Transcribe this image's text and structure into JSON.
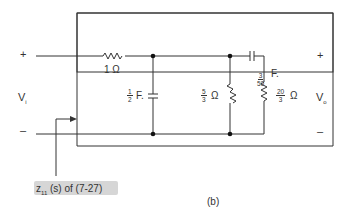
{
  "diagram": {
    "caption": "(b)",
    "annotation": {
      "prefix": "z",
      "sub": "11",
      "text": " (s) of (7-27)"
    },
    "input": {
      "plus": "+",
      "minus": "–",
      "label": "V",
      "label_sub": "i"
    },
    "output": {
      "plus": "+",
      "minus": "–",
      "label": "V",
      "label_sub": "o"
    },
    "components": {
      "r1": {
        "value": "1 Ω"
      },
      "c1": {
        "num": "1",
        "den": "2",
        "unit": "F."
      },
      "r2": {
        "num": "5",
        "den": "3",
        "unit": "Ω"
      },
      "c2": {
        "num": "3",
        "den": "50",
        "unit": "F."
      },
      "r3": {
        "num": "20",
        "den": "3",
        "unit": "Ω"
      }
    }
  }
}
